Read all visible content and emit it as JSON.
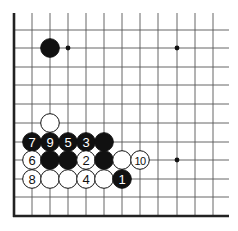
{
  "diagram": {
    "type": "go-board-fragment",
    "grid": {
      "columns_x": [
        14,
        32,
        50,
        68,
        86,
        104,
        122,
        140,
        158,
        177,
        195,
        213
      ],
      "rows_y": [
        30,
        48,
        67,
        85,
        104,
        123,
        142,
        160,
        179,
        197,
        216
      ],
      "line_top": 13,
      "line_right": 229,
      "left_edge_x": 14,
      "bottom_edge_y": 216,
      "line_color": "#555555",
      "edge_color": "#222222"
    },
    "star_points": [
      {
        "col": 3,
        "row": 1
      },
      {
        "col": 9,
        "row": 1
      },
      {
        "col": 9,
        "row": 7
      }
    ],
    "stones": [
      {
        "color": "black",
        "col": 2,
        "row": 1,
        "label": ""
      },
      {
        "color": "white",
        "col": 2,
        "row": 5,
        "label": ""
      },
      {
        "color": "black",
        "col": 1,
        "row": 6,
        "label": "7"
      },
      {
        "color": "black",
        "col": 2,
        "row": 6,
        "label": "9"
      },
      {
        "color": "black",
        "col": 3,
        "row": 6,
        "label": "5"
      },
      {
        "color": "black",
        "col": 4,
        "row": 6,
        "label": "3"
      },
      {
        "color": "black",
        "col": 5,
        "row": 6,
        "label": ""
      },
      {
        "color": "white",
        "col": 1,
        "row": 7,
        "label": "6"
      },
      {
        "color": "black",
        "col": 2,
        "row": 7,
        "label": ""
      },
      {
        "color": "black",
        "col": 3,
        "row": 7,
        "label": ""
      },
      {
        "color": "white",
        "col": 4,
        "row": 7,
        "label": "2"
      },
      {
        "color": "black",
        "col": 5,
        "row": 7,
        "label": ""
      },
      {
        "color": "white",
        "col": 6,
        "row": 7,
        "label": ""
      },
      {
        "color": "white",
        "col": 7,
        "row": 7,
        "label": "10"
      },
      {
        "color": "white",
        "col": 1,
        "row": 8,
        "label": "8"
      },
      {
        "color": "white",
        "col": 2,
        "row": 8,
        "label": ""
      },
      {
        "color": "white",
        "col": 3,
        "row": 8,
        "label": ""
      },
      {
        "color": "white",
        "col": 4,
        "row": 8,
        "label": "4"
      },
      {
        "color": "white",
        "col": 5,
        "row": 8,
        "label": ""
      },
      {
        "color": "black",
        "col": 6,
        "row": 8,
        "label": "1"
      }
    ],
    "stone_radius": 9.3,
    "colors": {
      "black_stone": "#111111",
      "white_stone": "#ffffff",
      "stone_outline": "#111111",
      "black_label": "#ffffff",
      "white_label": "#111111"
    }
  }
}
